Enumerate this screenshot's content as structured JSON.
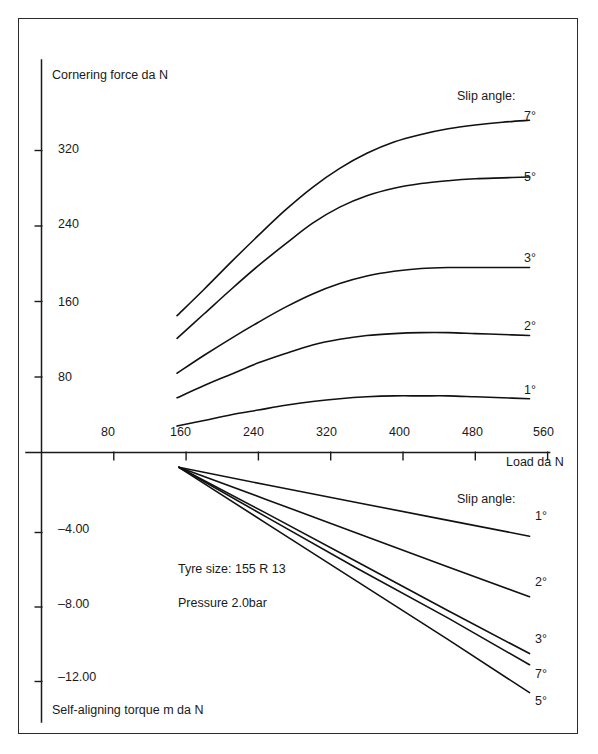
{
  "figure": {
    "background_color": "#ffffff",
    "frame_color": "#2b2b2b",
    "curve_color": "#111111"
  },
  "annotations": {
    "tyre_size": "Tyre size: 155 R 13",
    "pressure": "Pressure 2.0bar"
  },
  "chart_data": [
    {
      "type": "line",
      "id": "cornering-force",
      "title": "",
      "ylabel": "Cornering force da N",
      "xlabel": "Load da N",
      "legend_title": "Slip angle:",
      "legend_position": "right-inline",
      "grid": false,
      "xlim": [
        0,
        560
      ],
      "ylim": [
        0,
        400
      ],
      "xticks": [
        80,
        160,
        240,
        320,
        400,
        480,
        560
      ],
      "xtick_labels": [
        "80",
        "160",
        "240",
        "320",
        "400",
        "480",
        "560"
      ],
      "yticks": [
        80,
        160,
        240,
        320
      ],
      "ytick_labels": [
        "80",
        "160",
        "240",
        "320"
      ],
      "series": [
        {
          "name": "7°",
          "label": "7°",
          "x": [
            150,
            180,
            210,
            240,
            270,
            300,
            330,
            360,
            390,
            420,
            450,
            480,
            510,
            540
          ],
          "values": [
            145,
            173,
            202,
            230,
            257,
            281,
            301,
            317,
            329,
            337,
            343,
            347,
            350,
            352
          ]
        },
        {
          "name": "5°",
          "label": "5°",
          "x": [
            150,
            180,
            210,
            240,
            270,
            300,
            330,
            360,
            390,
            420,
            450,
            480,
            510,
            540
          ],
          "values": [
            121,
            147,
            173,
            198,
            221,
            243,
            260,
            272,
            280,
            285,
            288,
            290,
            291,
            292
          ]
        },
        {
          "name": "3°",
          "label": "3°",
          "x": [
            150,
            180,
            210,
            240,
            270,
            300,
            330,
            360,
            390,
            420,
            450,
            480,
            510,
            540
          ],
          "values": [
            84,
            103,
            121,
            138,
            154,
            168,
            179,
            187,
            192,
            195,
            196,
            196,
            196,
            196
          ]
        },
        {
          "name": "2°",
          "label": "2°",
          "x": [
            150,
            180,
            210,
            240,
            270,
            300,
            330,
            360,
            390,
            420,
            450,
            480,
            510,
            540
          ],
          "values": [
            58,
            71,
            83,
            95,
            105,
            114,
            120,
            124,
            126,
            127,
            127,
            126,
            125,
            124
          ]
        },
        {
          "name": "1°",
          "label": "1°",
          "x": [
            150,
            180,
            210,
            240,
            270,
            300,
            330,
            360,
            390,
            420,
            450,
            480,
            510,
            540
          ],
          "values": [
            28,
            34,
            40,
            45,
            50,
            54,
            57,
            59,
            60,
            60,
            60,
            59,
            58,
            57
          ]
        }
      ]
    },
    {
      "type": "line",
      "id": "self-aligning-torque",
      "title": "",
      "ylabel": "Self-aligning torque m da N",
      "xlabel": "Load da N",
      "legend_title": "Slip angle:",
      "legend_position": "right-inline",
      "grid": false,
      "xlim": [
        0,
        560
      ],
      "ylim": [
        -14,
        0
      ],
      "yticks": [
        -4.0,
        -8.0,
        -12.0
      ],
      "ytick_labels": [
        "–4.00",
        "–8.00",
        "–12.00"
      ],
      "series": [
        {
          "name": "1°",
          "label": "1°",
          "x": [
            152,
            250,
            350,
            450,
            540
          ],
          "values": [
            -0.5,
            -1.45,
            -2.4,
            -3.35,
            -4.2
          ]
        },
        {
          "name": "2°",
          "label": "2°",
          "x": [
            152,
            250,
            350,
            450,
            540
          ],
          "values": [
            -0.5,
            -2.25,
            -4.05,
            -5.85,
            -7.45
          ]
        },
        {
          "name": "3°",
          "label": "3°",
          "x": [
            152,
            250,
            350,
            450,
            540
          ],
          "values": [
            -0.5,
            -3.0,
            -5.6,
            -8.2,
            -10.5
          ]
        },
        {
          "name": "7°",
          "label": "7°",
          "x": [
            152,
            250,
            350,
            450,
            540
          ],
          "values": [
            -0.5,
            -3.2,
            -5.95,
            -8.6,
            -11.1
          ]
        },
        {
          "name": "5°",
          "label": "5°",
          "x": [
            152,
            250,
            350,
            450,
            540
          ],
          "values": [
            -0.5,
            -3.55,
            -6.65,
            -9.75,
            -12.6
          ]
        }
      ]
    }
  ]
}
